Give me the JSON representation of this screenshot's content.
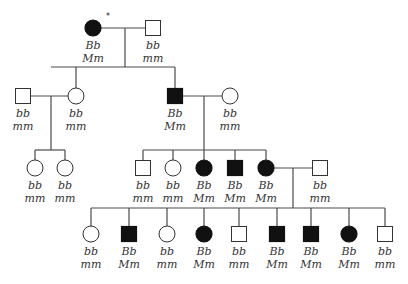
{
  "diagram": {
    "type": "pedigree",
    "colors": {
      "affected": "#111111",
      "unaffected": "#ffffff",
      "line": "#4a4a4a",
      "text": "#333333"
    },
    "proband_marker": "*",
    "individuals": [
      {
        "id": "I-1",
        "gen": 1,
        "sex": "female",
        "affected": true,
        "g1": "Bb",
        "g2": "Mm",
        "x": 93,
        "y": 28,
        "proband": true
      },
      {
        "id": "I-2",
        "gen": 1,
        "sex": "male",
        "affected": false,
        "g1": "bb",
        "g2": "mm",
        "x": 153,
        "y": 28
      },
      {
        "id": "II-1",
        "gen": 2,
        "sex": "male",
        "affected": false,
        "g1": "bb",
        "g2": "mm",
        "x": 23,
        "y": 96
      },
      {
        "id": "II-2",
        "gen": 2,
        "sex": "female",
        "affected": false,
        "g1": "bb",
        "g2": "mm",
        "x": 76,
        "y": 96
      },
      {
        "id": "II-3",
        "gen": 2,
        "sex": "male",
        "affected": true,
        "g1": "Bb",
        "g2": "Mm",
        "x": 175,
        "y": 96
      },
      {
        "id": "II-4",
        "gen": 2,
        "sex": "female",
        "affected": false,
        "g1": "bb",
        "g2": "mm",
        "x": 230,
        "y": 96
      },
      {
        "id": "III-1",
        "gen": 3,
        "sex": "female",
        "affected": false,
        "g1": "bb",
        "g2": "mm",
        "x": 35,
        "y": 168
      },
      {
        "id": "III-2",
        "gen": 3,
        "sex": "female",
        "affected": false,
        "g1": "bb",
        "g2": "mm",
        "x": 65,
        "y": 168
      },
      {
        "id": "III-3",
        "gen": 3,
        "sex": "male",
        "affected": false,
        "g1": "bb",
        "g2": "mm",
        "x": 143,
        "y": 168
      },
      {
        "id": "III-4",
        "gen": 3,
        "sex": "female",
        "affected": false,
        "g1": "bb",
        "g2": "mm",
        "x": 173,
        "y": 168
      },
      {
        "id": "III-5",
        "gen": 3,
        "sex": "female",
        "affected": true,
        "g1": "Bb",
        "g2": "Mm",
        "x": 204,
        "y": 168
      },
      {
        "id": "III-6",
        "gen": 3,
        "sex": "male",
        "affected": true,
        "g1": "Bb",
        "g2": "Mm",
        "x": 235,
        "y": 168
      },
      {
        "id": "III-7",
        "gen": 3,
        "sex": "female",
        "affected": true,
        "g1": "Bb",
        "g2": "Mm",
        "x": 266,
        "y": 168
      },
      {
        "id": "III-8",
        "gen": 3,
        "sex": "male",
        "affected": false,
        "g1": "bb",
        "g2": "mm",
        "x": 320,
        "y": 168
      },
      {
        "id": "IV-1",
        "gen": 4,
        "sex": "female",
        "affected": false,
        "g1": "bb",
        "g2": "mm",
        "x": 91,
        "y": 234
      },
      {
        "id": "IV-2",
        "gen": 4,
        "sex": "male",
        "affected": true,
        "g1": "Bb",
        "g2": "Mm",
        "x": 129,
        "y": 234
      },
      {
        "id": "IV-3",
        "gen": 4,
        "sex": "female",
        "affected": false,
        "g1": "bb",
        "g2": "mm",
        "x": 167,
        "y": 234
      },
      {
        "id": "IV-4",
        "gen": 4,
        "sex": "female",
        "affected": true,
        "g1": "Bb",
        "g2": "Mm",
        "x": 204,
        "y": 234
      },
      {
        "id": "IV-5",
        "gen": 4,
        "sex": "male",
        "affected": false,
        "g1": "bb",
        "g2": "mm",
        "x": 239,
        "y": 234
      },
      {
        "id": "IV-6",
        "gen": 4,
        "sex": "male",
        "affected": true,
        "g1": "Bb",
        "g2": "Mm",
        "x": 277,
        "y": 234
      },
      {
        "id": "IV-7",
        "gen": 4,
        "sex": "male",
        "affected": true,
        "g1": "Bb",
        "g2": "Mm",
        "x": 311,
        "y": 234
      },
      {
        "id": "IV-8",
        "gen": 4,
        "sex": "female",
        "affected": true,
        "g1": "Bb",
        "g2": "Mm",
        "x": 349,
        "y": 234
      },
      {
        "id": "IV-9",
        "gen": 4,
        "sex": "male",
        "affected": false,
        "g1": "bb",
        "g2": "mm",
        "x": 385,
        "y": 234
      }
    ],
    "lines": [
      [
        101,
        28,
        145,
        28
      ],
      [
        125,
        28,
        125,
        67
      ],
      [
        51,
        67,
        175,
        67
      ],
      [
        76,
        67,
        76,
        88
      ],
      [
        175,
        67,
        175,
        88
      ],
      [
        31,
        96,
        68,
        96
      ],
      [
        51,
        96,
        51,
        150
      ],
      [
        35,
        150,
        65,
        150
      ],
      [
        35,
        150,
        35,
        160
      ],
      [
        65,
        150,
        65,
        160
      ],
      [
        183,
        96,
        222,
        96
      ],
      [
        204,
        96,
        204,
        150
      ],
      [
        143,
        150,
        266,
        150
      ],
      [
        143,
        150,
        143,
        160
      ],
      [
        173,
        150,
        173,
        160
      ],
      [
        204,
        150,
        204,
        160
      ],
      [
        235,
        150,
        235,
        160
      ],
      [
        266,
        150,
        266,
        160
      ],
      [
        274,
        168,
        312,
        168
      ],
      [
        293,
        168,
        293,
        208
      ],
      [
        91,
        208,
        385,
        208
      ],
      [
        91,
        208,
        91,
        226
      ],
      [
        129,
        208,
        129,
        226
      ],
      [
        167,
        208,
        167,
        226
      ],
      [
        204,
        208,
        204,
        226
      ],
      [
        239,
        208,
        239,
        226
      ],
      [
        277,
        208,
        277,
        226
      ],
      [
        311,
        208,
        311,
        226
      ],
      [
        349,
        208,
        349,
        226
      ],
      [
        385,
        208,
        385,
        226
      ]
    ]
  }
}
